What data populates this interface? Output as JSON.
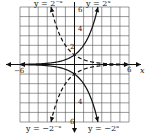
{
  "chart_data": {
    "type": "line",
    "title": "",
    "xlabel": "x",
    "ylabel": "",
    "xlim": [
      -6,
      6
    ],
    "ylim": [
      -6,
      6
    ],
    "grid": true,
    "x_ticks_labeled": [
      "-6",
      "6"
    ],
    "y_ticks_labeled": [
      "2",
      "4",
      "6",
      "-6"
    ],
    "series": [
      {
        "name": "y = 2^x",
        "style": "solid",
        "x": [
          -6,
          -4,
          -2,
          0,
          1,
          2,
          2.58
        ],
        "y": [
          0.016,
          0.0625,
          0.25,
          1,
          2,
          4,
          6
        ]
      },
      {
        "name": "y = 2^-x",
        "style": "dashed",
        "x": [
          -2.58,
          -2,
          -1,
          0,
          2,
          4,
          6
        ],
        "y": [
          6,
          4,
          2,
          1,
          0.25,
          0.0625,
          0.016
        ]
      },
      {
        "name": "y = -2^-x",
        "style": "dashed",
        "x": [
          -2.58,
          -2,
          -1,
          0,
          2,
          4,
          6
        ],
        "y": [
          -6,
          -4,
          -2,
          -1,
          -0.25,
          -0.0625,
          -0.016
        ]
      },
      {
        "name": "y = -2^x",
        "style": "solid",
        "x": [
          -6,
          -4,
          -2,
          0,
          1,
          2,
          2.58
        ],
        "y": [
          -0.016,
          -0.0625,
          -0.25,
          -1,
          -2,
          -4,
          -6
        ]
      }
    ]
  },
  "labels": {
    "top_left": "y = 2⁻ˣ",
    "top_right": "y = 2ˣ",
    "bottom_left": "y = −2⁻ˣ",
    "bottom_right": "y = −2ˣ",
    "x_axis": "x",
    "x_min": "−6",
    "x_max": "6",
    "y_2": "2",
    "y_4": "4",
    "y_6": "6",
    "y_neg6": "6",
    "y_neg4": "4"
  }
}
